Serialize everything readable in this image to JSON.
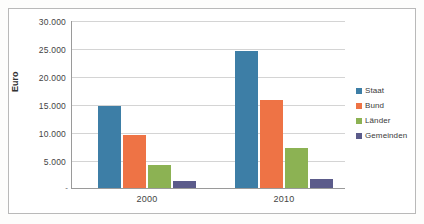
{
  "chart_data": {
    "type": "bar",
    "title": "",
    "subtitle": "",
    "xlabel": "",
    "ylabel": "Euro",
    "categories": [
      "2000",
      "2010"
    ],
    "series": [
      {
        "name": "Staat",
        "values": [
          14800,
          24600
        ],
        "color": "#3d7ea6"
      },
      {
        "name": "Bund",
        "values": [
          9450,
          15800
        ],
        "color": "#ee7345"
      },
      {
        "name": "Länder",
        "values": [
          4150,
          7250
        ],
        "color": "#8bb martial"
      },
      {
        "name": "Gemeinden",
        "values": [
          1350,
          1700
        ],
        "color": "#5b5b8a"
      }
    ],
    "ylim": [
      0,
      30000
    ],
    "ytick_values": [
      0,
      5000,
      10000,
      15000,
      20000,
      25000,
      30000
    ],
    "ytick_labels": [
      "-",
      "5.000",
      "10.000",
      "15.000",
      "20.000",
      "25.000",
      "30.000"
    ],
    "grid": "horizontal",
    "legend_position": "right"
  },
  "legend": {
    "entries": [
      {
        "label": "Staat"
      },
      {
        "label": "Bund"
      },
      {
        "label": "Länder"
      },
      {
        "label": "Gemeinden"
      }
    ]
  },
  "axis": {
    "y_title": "Euro",
    "y_labels": {
      "t30000": "30.000",
      "t25000": "25.000",
      "t20000": "20.000",
      "t15000": "15.000",
      "t10000": "10.000",
      "t5000": "5.000",
      "t0": "-"
    },
    "x_labels": {
      "g0": "2000",
      "g1": "2010"
    }
  },
  "colors": {
    "staat": "#3d7ea6",
    "bund": "#ee7345",
    "laender": "#8cb253",
    "gemeinden": "#5b5b8a",
    "gridline": "#d4d4d4",
    "axis": "#9a9a9a",
    "frame": "#b9b9b9",
    "plot_background": "#ffffff",
    "page_background": "#fdfdfc"
  }
}
